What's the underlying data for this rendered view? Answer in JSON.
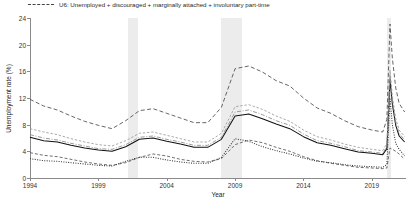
{
  "legend": {
    "entries": [
      {
        "label": "U5: Unemployed + discouraged + marginally attached workers",
        "style": "dash"
      },
      {
        "label": "U6: Unemployed + discouraged + marginally attached + involuntary part-time",
        "style": "longdash"
      }
    ]
  },
  "axes": {
    "ylabel": "Unemployment rate (%)",
    "xlabel": "Year",
    "yticks": [
      "0",
      "4",
      "8",
      "12",
      "16",
      "20",
      "24"
    ],
    "xticks": [
      "1994",
      "1999",
      "2004",
      "2009",
      "2014",
      "2019"
    ]
  },
  "footnote": {
    "text": ""
  },
  "chart_data": {
    "type": "line",
    "title": "",
    "xlabel": "Year",
    "ylabel": "Unemployment rate (%)",
    "xlim": [
      1994,
      2021.5
    ],
    "ylim": [
      0,
      24
    ],
    "yticks": [
      0,
      4,
      8,
      12,
      16,
      20,
      24
    ],
    "xticks": [
      1994,
      1999,
      2004,
      2009,
      2014,
      2019
    ],
    "grid": false,
    "legend_position": "above-plot",
    "shaded_regions": [
      {
        "name": "recession-2001",
        "x0": 2001.2,
        "x1": 2001.9
      },
      {
        "name": "recession-2008",
        "x0": 2007.95,
        "x1": 2009.5
      },
      {
        "name": "recession-2020",
        "x0": 2020.1,
        "x1": 2020.4
      }
    ],
    "x": [
      1994,
      1995,
      1996,
      1997,
      1998,
      1999,
      2000,
      2001,
      2002,
      2003,
      2004,
      2005,
      2006,
      2007,
      2008,
      2009,
      2010,
      2011,
      2012,
      2013,
      2014,
      2015,
      2016,
      2017,
      2018,
      2019,
      2019.8,
      2020.1,
      2020.33,
      2020.5,
      2020.75,
      2021,
      2021.4
    ],
    "series": [
      {
        "name": "U1",
        "style": "dashed",
        "values": [
          3.8,
          3.4,
          3.2,
          2.8,
          2.4,
          2.1,
          1.9,
          2.3,
          3.1,
          3.6,
          3.3,
          2.8,
          2.5,
          2.4,
          2.9,
          5.0,
          5.7,
          5.3,
          4.6,
          4.0,
          3.2,
          2.6,
          2.2,
          1.9,
          1.6,
          1.5,
          1.4,
          1.5,
          4.5,
          4.3,
          4.0,
          3.6,
          2.8
        ]
      },
      {
        "name": "U2",
        "style": "dotted",
        "values": [
          2.9,
          2.6,
          2.5,
          2.3,
          2.1,
          1.9,
          1.8,
          2.5,
          3.1,
          3.1,
          2.7,
          2.4,
          2.2,
          2.2,
          3.1,
          5.9,
          5.5,
          4.7,
          4.1,
          3.6,
          3.0,
          2.5,
          2.3,
          2.0,
          1.8,
          1.7,
          1.6,
          2.0,
          12.0,
          8.0,
          5.2,
          4.3,
          3.3
        ]
      },
      {
        "name": "U3",
        "style": "solid",
        "values": [
          6.1,
          5.6,
          5.4,
          4.9,
          4.5,
          4.2,
          4.0,
          4.7,
          5.8,
          6.0,
          5.5,
          5.1,
          4.6,
          4.6,
          5.8,
          9.3,
          9.6,
          8.9,
          8.1,
          7.4,
          6.2,
          5.3,
          4.9,
          4.4,
          3.9,
          3.7,
          3.5,
          4.4,
          14.8,
          11.1,
          7.9,
          6.3,
          5.4
        ]
      },
      {
        "name": "U4",
        "style": "dashdot",
        "values": [
          6.5,
          6.0,
          5.7,
          5.2,
          4.8,
          4.4,
          4.3,
          5.0,
          6.1,
          6.3,
          5.8,
          5.4,
          4.9,
          4.9,
          6.1,
          9.9,
          10.2,
          9.5,
          8.6,
          7.9,
          6.6,
          5.6,
          5.2,
          4.7,
          4.1,
          3.9,
          3.7,
          4.7,
          15.4,
          11.6,
          8.3,
          6.7,
          5.7
        ]
      },
      {
        "name": "U5",
        "style": "dash",
        "values": [
          7.4,
          6.9,
          6.5,
          5.9,
          5.4,
          5.0,
          4.8,
          5.6,
          6.7,
          6.9,
          6.4,
          5.9,
          5.4,
          5.4,
          6.7,
          10.7,
          11.0,
          10.3,
          9.3,
          8.5,
          7.2,
          6.2,
          5.7,
          5.1,
          4.6,
          4.3,
          4.1,
          5.2,
          16.2,
          12.3,
          8.9,
          7.2,
          6.2
        ]
      },
      {
        "name": "U6",
        "style": "longdash",
        "values": [
          11.8,
          10.8,
          10.2,
          9.3,
          8.5,
          7.9,
          7.4,
          8.6,
          10.1,
          10.4,
          9.7,
          9.0,
          8.3,
          8.3,
          10.6,
          16.4,
          16.8,
          15.9,
          14.6,
          13.8,
          12.0,
          10.5,
          9.7,
          8.6,
          7.7,
          7.2,
          6.9,
          8.8,
          23.1,
          18.0,
          13.5,
          11.2,
          9.9
        ]
      }
    ]
  }
}
